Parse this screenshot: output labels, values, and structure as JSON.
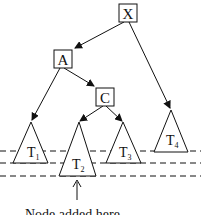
{
  "diagram": {
    "type": "binary-tree-insertion",
    "nodes": [
      {
        "id": "X",
        "label": "X"
      },
      {
        "id": "A",
        "label": "A"
      },
      {
        "id": "C",
        "label": "C"
      }
    ],
    "subtrees": [
      {
        "id": "T1",
        "label": "T",
        "sub": "1"
      },
      {
        "id": "T2",
        "label": "T",
        "sub": "2"
      },
      {
        "id": "T3",
        "label": "T",
        "sub": "3"
      },
      {
        "id": "T4",
        "label": "T",
        "sub": "4"
      }
    ],
    "edges": [
      {
        "from": "X",
        "to": "A"
      },
      {
        "from": "X",
        "to": "T4"
      },
      {
        "from": "A",
        "to": "T1"
      },
      {
        "from": "A",
        "to": "C"
      },
      {
        "from": "C",
        "to": "T2"
      },
      {
        "from": "C",
        "to": "T3"
      }
    ],
    "annotation": "Node added here",
    "colors": {
      "stroke": "#111111",
      "background": "#ffffff"
    }
  }
}
